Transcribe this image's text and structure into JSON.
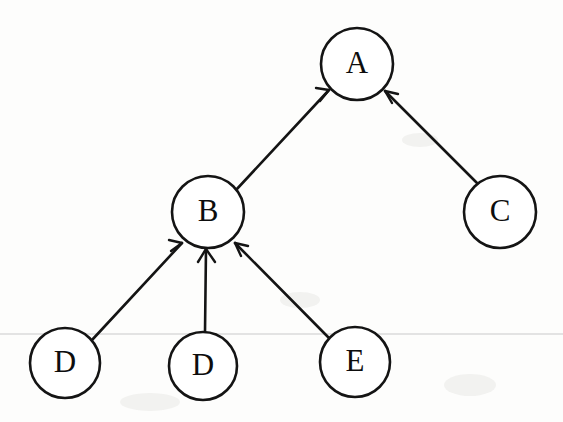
{
  "figure": {
    "kind": "directed-graph",
    "background_color": "#fdfdfc",
    "ink_color": "#141414",
    "rule_line_color": "#c9c9c9",
    "width": 563,
    "height": 422
  },
  "nodes": [
    {
      "id": "A",
      "label": "A",
      "cx": 357,
      "cy": 64,
      "r": 36
    },
    {
      "id": "B",
      "label": "B",
      "cx": 208,
      "cy": 212,
      "r": 36
    },
    {
      "id": "C",
      "label": "C",
      "cx": 500,
      "cy": 212,
      "r": 36
    },
    {
      "id": "D1",
      "label": "D",
      "cx": 65,
      "cy": 363,
      "r": 35
    },
    {
      "id": "D2",
      "label": "D",
      "cx": 203,
      "cy": 366,
      "r": 34
    },
    {
      "id": "E",
      "label": "E",
      "cx": 355,
      "cy": 362,
      "r": 35
    }
  ],
  "edges": [
    {
      "from": "B",
      "to": "A",
      "directed": true,
      "arrow_at": "A"
    },
    {
      "from": "C",
      "to": "A",
      "directed": true,
      "arrow_at": "A"
    },
    {
      "from": "D1",
      "to": "B",
      "directed": true,
      "arrow_at": "B"
    },
    {
      "from": "D2",
      "to": "B",
      "directed": true,
      "arrow_at": "B"
    },
    {
      "from": "E",
      "to": "B",
      "directed": true,
      "arrow_at": "B"
    }
  ],
  "annotations": {
    "rule_line_y": 334
  }
}
